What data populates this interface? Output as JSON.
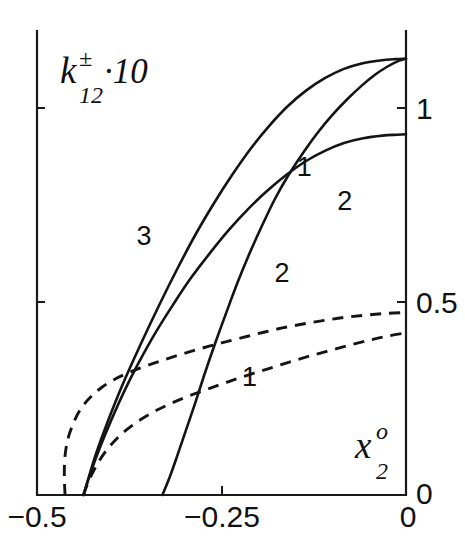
{
  "chart_data": {
    "type": "line",
    "title": "",
    "subtitle": "",
    "ylabel_parts": {
      "base": "k",
      "sup": "±",
      "sub": "12",
      "suffix": "·10"
    },
    "ylabel": "k±_12·10",
    "xlabel_parts": {
      "base": "x",
      "sup": "o",
      "sub": "2"
    },
    "xlabel": "x^o_2",
    "xlim": [
      -0.5,
      0.0
    ],
    "ylim": [
      0.0,
      1.07
    ],
    "xticks": [
      -0.5,
      -0.25,
      0
    ],
    "xticklabels": [
      "−0.5",
      "−0.25",
      "0"
    ],
    "yticks": [
      0,
      0.5,
      1
    ],
    "yticklabels": [
      "0",
      "0.5",
      "1"
    ],
    "grid": false,
    "legend": "inline-curve-labels",
    "axis_note": "y ticks on right side of frame; frame drawn on left, bottom and right",
    "series": [
      {
        "name": "3",
        "style": "solid",
        "label": "3",
        "label_x": -0.355,
        "label_y": 0.575,
        "points": [
          [
            -0.437,
            0.0
          ],
          [
            -0.43,
            0.04
          ],
          [
            -0.42,
            0.095
          ],
          [
            -0.405,
            0.165
          ],
          [
            -0.385,
            0.25
          ],
          [
            -0.36,
            0.345
          ],
          [
            -0.335,
            0.435
          ],
          [
            -0.31,
            0.52
          ],
          [
            -0.285,
            0.6
          ],
          [
            -0.26,
            0.672
          ],
          [
            -0.235,
            0.738
          ],
          [
            -0.21,
            0.798
          ],
          [
            -0.185,
            0.85
          ],
          [
            -0.16,
            0.895
          ],
          [
            -0.135,
            0.931
          ],
          [
            -0.11,
            0.959
          ],
          [
            -0.085,
            0.98
          ],
          [
            -0.06,
            0.993
          ],
          [
            -0.035,
            1.0
          ],
          [
            -0.015,
            1.003
          ],
          [
            0.0,
            1.004
          ]
        ]
      },
      {
        "name": "1",
        "style": "solid",
        "label": "1",
        "label_x": -0.138,
        "label_y": 0.735,
        "points": [
          [
            -0.33,
            0.0
          ],
          [
            -0.32,
            0.042
          ],
          [
            -0.31,
            0.09
          ],
          [
            -0.298,
            0.15
          ],
          [
            -0.285,
            0.215
          ],
          [
            -0.272,
            0.283
          ],
          [
            -0.258,
            0.352
          ],
          [
            -0.243,
            0.422
          ],
          [
            -0.228,
            0.49
          ],
          [
            -0.212,
            0.556
          ],
          [
            -0.195,
            0.62
          ],
          [
            -0.178,
            0.68
          ],
          [
            -0.16,
            0.734
          ],
          [
            -0.14,
            0.786
          ],
          [
            -0.12,
            0.833
          ],
          [
            -0.1,
            0.874
          ],
          [
            -0.08,
            0.91
          ],
          [
            -0.06,
            0.942
          ],
          [
            -0.042,
            0.967
          ],
          [
            -0.025,
            0.986
          ],
          [
            -0.01,
            0.999
          ],
          [
            0.0,
            1.004
          ]
        ]
      },
      {
        "name": "2",
        "style": "solid",
        "label": "2",
        "label_x": -0.083,
        "label_y": 0.655,
        "points": [
          [
            -0.437,
            0.0
          ],
          [
            -0.428,
            0.048
          ],
          [
            -0.415,
            0.108
          ],
          [
            -0.4,
            0.17
          ],
          [
            -0.382,
            0.238
          ],
          [
            -0.362,
            0.305
          ],
          [
            -0.34,
            0.372
          ],
          [
            -0.316,
            0.437
          ],
          [
            -0.292,
            0.498
          ],
          [
            -0.266,
            0.556
          ],
          [
            -0.24,
            0.61
          ],
          [
            -0.214,
            0.658
          ],
          [
            -0.188,
            0.7
          ],
          [
            -0.162,
            0.737
          ],
          [
            -0.136,
            0.768
          ],
          [
            -0.11,
            0.792
          ],
          [
            -0.084,
            0.81
          ],
          [
            -0.058,
            0.821
          ],
          [
            -0.032,
            0.827
          ],
          [
            -0.012,
            0.829
          ],
          [
            0.0,
            0.83
          ]
        ]
      },
      {
        "name": "2",
        "style": "dashed",
        "label": "2",
        "label_x": -0.168,
        "label_y": 0.49,
        "points": [
          [
            -0.462,
            0.0
          ],
          [
            -0.463,
            0.045
          ],
          [
            -0.462,
            0.09
          ],
          [
            -0.458,
            0.13
          ],
          [
            -0.45,
            0.168
          ],
          [
            -0.44,
            0.2
          ],
          [
            -0.427,
            0.226
          ],
          [
            -0.412,
            0.248
          ],
          [
            -0.395,
            0.266
          ],
          [
            -0.375,
            0.282
          ],
          [
            -0.352,
            0.297
          ],
          [
            -0.328,
            0.311
          ],
          [
            -0.302,
            0.325
          ],
          [
            -0.276,
            0.338
          ],
          [
            -0.25,
            0.35
          ],
          [
            -0.222,
            0.362
          ],
          [
            -0.194,
            0.374
          ],
          [
            -0.166,
            0.385
          ],
          [
            -0.138,
            0.394
          ],
          [
            -0.11,
            0.402
          ],
          [
            -0.082,
            0.409
          ],
          [
            -0.054,
            0.414
          ],
          [
            -0.026,
            0.418
          ],
          [
            0.0,
            0.42
          ]
        ]
      },
      {
        "name": "1",
        "style": "dashed",
        "label": "1",
        "label_x": -0.212,
        "label_y": 0.25,
        "points": [
          [
            -0.437,
            0.0
          ],
          [
            -0.43,
            0.032
          ],
          [
            -0.42,
            0.066
          ],
          [
            -0.408,
            0.098
          ],
          [
            -0.394,
            0.126
          ],
          [
            -0.378,
            0.151
          ],
          [
            -0.36,
            0.173
          ],
          [
            -0.34,
            0.193
          ],
          [
            -0.318,
            0.211
          ],
          [
            -0.294,
            0.228
          ],
          [
            -0.268,
            0.244
          ],
          [
            -0.242,
            0.26
          ],
          [
            -0.214,
            0.276
          ],
          [
            -0.186,
            0.291
          ],
          [
            -0.158,
            0.306
          ],
          [
            -0.13,
            0.32
          ],
          [
            -0.102,
            0.333
          ],
          [
            -0.074,
            0.346
          ],
          [
            -0.048,
            0.357
          ],
          [
            -0.024,
            0.366
          ],
          [
            0.0,
            0.373
          ]
        ]
      }
    ],
    "colors": {
      "ink": "#141414",
      "axis": "#1a1a1a",
      "background": "#ffffff"
    }
  }
}
